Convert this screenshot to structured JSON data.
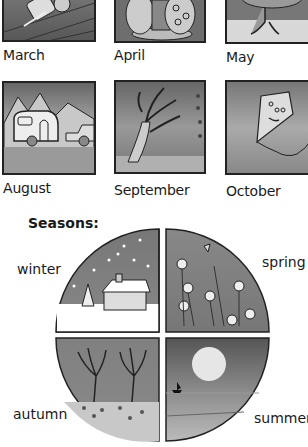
{
  "months": [
    {
      "label": "March",
      "scene": "rolling-log-icon"
    },
    {
      "label": "April",
      "scene": "easter-eggs-icon"
    },
    {
      "label": "May",
      "scene": "tree-meadow-icon"
    },
    {
      "label": "August",
      "scene": "caravan-mountains-icon"
    },
    {
      "label": "September",
      "scene": "windy-tree-icon"
    },
    {
      "label": "October",
      "scene": "kite-icon"
    }
  ],
  "seasons": {
    "title": "Seasons:",
    "items": [
      {
        "label": "winter",
        "scene": "snowy-house-icon"
      },
      {
        "label": "spring",
        "scene": "flowers-icon"
      },
      {
        "label": "autumn",
        "scene": "bare-trees-icon"
      },
      {
        "label": "summer",
        "scene": "moon-sea-boat-icon"
      }
    ]
  }
}
